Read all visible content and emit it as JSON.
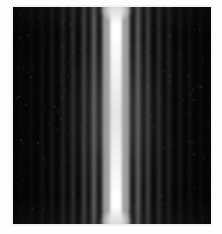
{
  "figure": {
    "kind": "photograph",
    "caption": "",
    "background_color": "#fdfdfd",
    "plate": {
      "field_color": "#050505",
      "margin_color": "#f2f2f2",
      "left": 13,
      "top": 7,
      "width": 198,
      "height": 217
    }
  },
  "chart_data": {
    "type": "line",
    "title": "",
    "subtitle": "",
    "xlabel": "",
    "ylabel": "",
    "grid": false,
    "legend": null,
    "orientation": "vertical-fringes",
    "center_x": 103,
    "fringe_spacing_px": 10.5,
    "x": [
      -95,
      -85,
      -74,
      -64,
      -53,
      -43,
      -32,
      -22,
      -11,
      0,
      11,
      22,
      32,
      43,
      53,
      64,
      74,
      85,
      95
    ],
    "values": [
      0.02,
      0.03,
      0.05,
      0.07,
      0.1,
      0.15,
      0.22,
      0.34,
      0.55,
      1.0,
      0.55,
      0.34,
      0.22,
      0.15,
      0.1,
      0.07,
      0.05,
      0.03,
      0.02
    ],
    "ylim": [
      0,
      1
    ],
    "peak_color": "#ffffff",
    "background_color": "#050505",
    "fringes": [
      {
        "order": -9,
        "offset_px": -95,
        "width_px": 5,
        "intensity": 0.02,
        "color": "#ffffff"
      },
      {
        "order": -8,
        "offset_px": -85,
        "width_px": 5,
        "intensity": 0.03,
        "color": "#ffffff"
      },
      {
        "order": -7,
        "offset_px": -74,
        "width_px": 5,
        "intensity": 0.05,
        "color": "#ffffff"
      },
      {
        "order": -6,
        "offset_px": -64,
        "width_px": 5,
        "intensity": 0.07,
        "color": "#ffffff"
      },
      {
        "order": -5,
        "offset_px": -53,
        "width_px": 6,
        "intensity": 0.105,
        "color": "#ffffff"
      },
      {
        "order": -4,
        "offset_px": -43,
        "width_px": 6,
        "intensity": 0.15,
        "color": "#ffffff"
      },
      {
        "order": -3,
        "offset_px": -32,
        "width_px": 6,
        "intensity": 0.225,
        "color": "#ffffff"
      },
      {
        "order": -2,
        "offset_px": -22,
        "width_px": 7,
        "intensity": 0.34,
        "color": "#ffffff"
      },
      {
        "order": -1,
        "offset_px": -11,
        "width_px": 7,
        "intensity": 0.55,
        "color": "#ffffff"
      },
      {
        "order": 1,
        "offset_px": 11,
        "width_px": 7,
        "intensity": 0.55,
        "color": "#ffffff"
      },
      {
        "order": 2,
        "offset_px": 22,
        "width_px": 7,
        "intensity": 0.34,
        "color": "#ffffff"
      },
      {
        "order": 3,
        "offset_px": 32,
        "width_px": 6,
        "intensity": 0.225,
        "color": "#ffffff"
      },
      {
        "order": 4,
        "offset_px": 43,
        "width_px": 6,
        "intensity": 0.15,
        "color": "#ffffff"
      },
      {
        "order": 5,
        "offset_px": 53,
        "width_px": 6,
        "intensity": 0.105,
        "color": "#ffffff"
      },
      {
        "order": 6,
        "offset_px": 64,
        "width_px": 5,
        "intensity": 0.07,
        "color": "#ffffff"
      },
      {
        "order": 7,
        "offset_px": 74,
        "width_px": 5,
        "intensity": 0.05,
        "color": "#ffffff"
      },
      {
        "order": 8,
        "offset_px": 85,
        "width_px": 5,
        "intensity": 0.03,
        "color": "#ffffff"
      },
      {
        "order": 9,
        "offset_px": 95,
        "width_px": 5,
        "intensity": 0.02,
        "color": "#ffffff"
      }
    ],
    "central_maximum": {
      "order": 0,
      "offset_px": 0,
      "core_width_px": 14,
      "intensity": 1.0,
      "color": "#ffffff",
      "saturated": true
    },
    "beam_flares": [
      {
        "position": "top",
        "intensity": 1.0,
        "color": "#ffffff"
      },
      {
        "position": "bottom",
        "intensity": 1.0,
        "color": "#ffffff"
      }
    ]
  },
  "grain": {
    "speckle_count": 460,
    "seed": 20250614
  }
}
